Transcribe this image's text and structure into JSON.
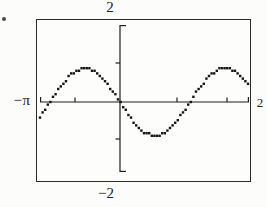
{
  "figure": {
    "kind": "graphing-calculator screen plot (textbook scan)",
    "bullet_marker": "•"
  },
  "colors": {
    "ink": "#1f1f1f",
    "curve_dot": "#161616",
    "paper": "#fcfcfa",
    "border": "#2b2b2b"
  },
  "chart_data": {
    "type": "line",
    "title": "",
    "xlabel": "",
    "ylabel": "",
    "axis_labels": {
      "y_max": "2",
      "y_min": "−2",
      "x_min": "−π",
      "x_max": "2"
    },
    "ylim": [
      -2,
      2
    ],
    "grid": false,
    "legend": null,
    "x_ticks_px": [
      75,
      177,
      227
    ],
    "y_ticks_px": [
      63,
      139
    ],
    "pixel_frame": {
      "x_start": 40,
      "x_end": 249,
      "x_axis_y": 102,
      "y_axis_x": 120,
      "y_top": 25,
      "y_bottom": 172,
      "unit_px": 38,
      "end_tick": 5,
      "tick": 4.5,
      "dot": 2.4,
      "step": 2.6
    },
    "curve": {
      "shape": "sinusoid",
      "amplitude_units": 0.9,
      "period_fraction_of_width": 0.67,
      "samples": [
        [
          0.0,
          -0.39
        ],
        [
          0.05,
          0.02
        ],
        [
          0.1,
          0.42
        ],
        [
          0.15,
          0.74
        ],
        [
          0.2,
          0.89
        ],
        [
          0.25,
          0.85
        ],
        [
          0.3,
          0.63
        ],
        [
          0.35,
          0.27
        ],
        [
          0.4,
          -0.15
        ],
        [
          0.45,
          -0.53
        ],
        [
          0.5,
          -0.8
        ],
        [
          0.55,
          -0.9
        ],
        [
          0.6,
          -0.8
        ],
        [
          0.65,
          -0.53
        ],
        [
          0.7,
          -0.15
        ],
        [
          0.75,
          0.27
        ],
        [
          0.8,
          0.63
        ],
        [
          0.85,
          0.85
        ],
        [
          0.9,
          0.89
        ],
        [
          0.95,
          0.74
        ],
        [
          1.0,
          0.43
        ]
      ]
    }
  }
}
